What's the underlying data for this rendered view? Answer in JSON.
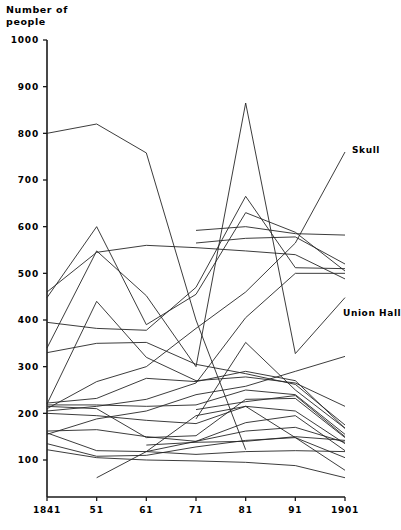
{
  "chart_data": {
    "type": "line",
    "title": "",
    "ylabel": "Number of\npeople",
    "xlabel": "",
    "ylim": [
      0,
      1000
    ],
    "ytick_values": [
      100,
      200,
      300,
      400,
      500,
      600,
      700,
      800,
      900,
      1000
    ],
    "ytick_labels": [
      "100",
      "200",
      "300",
      "400",
      "500",
      "600",
      "700",
      "800",
      "900",
      "1000"
    ],
    "grid": false,
    "legend_position": "inline-annotations",
    "categories": [
      "1841",
      "51",
      "61",
      "71",
      "81",
      "91",
      "1901"
    ],
    "x_values": [
      1841,
      1851,
      1861,
      1871,
      1881,
      1891,
      1901
    ],
    "annotations": [
      {
        "text": "Skull",
        "x": 352,
        "y": 153
      },
      {
        "text": "Union Hall",
        "x": 343,
        "y": 316
      }
    ],
    "series": [
      {
        "name": "Skull",
        "values": [
          210,
          268,
          300,
          382,
          460,
          565,
          760
        ]
      },
      {
        "name": "Union Hall",
        "values": [
          155,
          188,
          205,
          240,
          258,
          290,
          322
        ]
      },
      {
        "name": "series-3",
        "values": [
          800,
          820,
          758,
          400,
          122,
          null,
          null
        ]
      },
      {
        "name": "series-4",
        "values": [
          460,
          545,
          560,
          555,
          548,
          540,
          488
        ]
      },
      {
        "name": "series-5",
        "values": [
          null,
          null,
          null,
          592,
          600,
          585,
          582
        ]
      },
      {
        "name": "series-6",
        "values": [
          null,
          null,
          null,
          565,
          575,
          578,
          520
        ]
      },
      {
        "name": "series-7",
        "values": [
          448,
          600,
          390,
          455,
          630,
          588,
          505
        ]
      },
      {
        "name": "series-8",
        "values": [
          340,
          548,
          452,
          300,
          865,
          328,
          448
        ]
      },
      {
        "name": "series-9",
        "values": [
          395,
          382,
          378,
          470,
          665,
          512,
          510
        ]
      },
      {
        "name": "series-10",
        "values": [
          205,
          215,
          230,
          265,
          405,
          500,
          500
        ]
      },
      {
        "name": "series-11",
        "values": [
          220,
          440,
          320,
          270,
          278,
          265,
          215
        ]
      },
      {
        "name": "series-12",
        "values": [
          330,
          350,
          352,
          305,
          285,
          262,
          175
        ]
      },
      {
        "name": "series-13",
        "values": [
          222,
          232,
          275,
          268,
          290,
          270,
          168
        ]
      },
      {
        "name": "series-14",
        "values": [
          218,
          218,
          215,
          218,
          250,
          240,
          155
        ]
      },
      {
        "name": "series-15",
        "values": [
          215,
          210,
          148,
          152,
          230,
          232,
          148
        ]
      },
      {
        "name": "series-16",
        "values": [
          200,
          195,
          185,
          178,
          215,
          205,
          135
        ]
      },
      {
        "name": "series-17",
        "values": [
          162,
          165,
          150,
          140,
          180,
          195,
          120
        ]
      },
      {
        "name": "series-18",
        "values": [
          158,
          120,
          118,
          140,
          162,
          170,
          138
        ]
      },
      {
        "name": "series-19",
        "values": [
          135,
          108,
          110,
          128,
          142,
          148,
          105
        ]
      },
      {
        "name": "series-20",
        "values": [
          122,
          105,
          100,
          98,
          95,
          88,
          62
        ]
      },
      {
        "name": "series-21",
        "values": [
          null,
          62,
          118,
          195,
          215,
          148,
          78
        ]
      },
      {
        "name": "series-22",
        "values": [
          null,
          null,
          132,
          138,
          140,
          150,
          142
        ]
      },
      {
        "name": "series-23",
        "values": [
          null,
          null,
          118,
          112,
          118,
          120,
          118
        ]
      },
      {
        "name": "series-24",
        "values": [
          null,
          null,
          null,
          188,
          352,
          250,
          168
        ]
      },
      {
        "name": "series-25",
        "values": [
          null,
          null,
          null,
          208,
          225,
          238,
          150
        ]
      }
    ]
  },
  "axes": {
    "y_axis_name": "y-axis",
    "x_axis_name": "x-axis"
  },
  "colors": {
    "line": "#262626",
    "axis": "#1a1a1a",
    "background": "#ffffff",
    "text": "#000000"
  }
}
